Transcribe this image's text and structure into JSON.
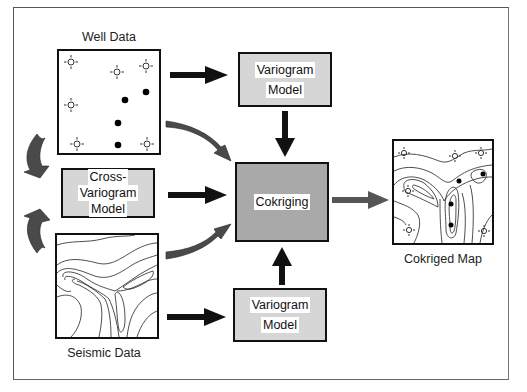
{
  "diagram": {
    "nodes": {
      "well_data": {
        "caption": "Well Data"
      },
      "variogram_top": {
        "line1": "Variogram",
        "line2": "Model"
      },
      "cross_variogram": {
        "line1": "Cross-",
        "line2": "Variogram",
        "line3": "Model"
      },
      "cokriging": {
        "label": "Cokriging"
      },
      "seismic_data": {
        "caption": "Seismic Data"
      },
      "variogram_bottom": {
        "line1": "Variogram",
        "line2": "Model"
      },
      "cokriged_map": {
        "caption": "Cokriged Map"
      }
    },
    "edges": [
      {
        "from": "Well Data",
        "to": "Variogram Model (top)",
        "style": "straight-black"
      },
      {
        "from": "Variogram Model (top)",
        "to": "Cokriging",
        "style": "straight-black"
      },
      {
        "from": "Well Data",
        "to": "Cokriging",
        "style": "curved-gray"
      },
      {
        "from": "Cross-Variogram Model",
        "to": "Cokriging",
        "style": "straight-black"
      },
      {
        "from": "Seismic Data",
        "to": "Cokriging",
        "style": "curved-gray"
      },
      {
        "from": "Seismic Data",
        "to": "Variogram Model (bottom)",
        "style": "straight-black"
      },
      {
        "from": "Variogram Model (bottom)",
        "to": "Cokriging",
        "style": "straight-black"
      },
      {
        "from": "Cokriging",
        "to": "Cokriged Map",
        "style": "straight-gray"
      },
      {
        "from": "Well Data",
        "to": "Cross-Variogram Model",
        "style": "curved-gray"
      },
      {
        "from": "Seismic Data",
        "to": "Cross-Variogram Model",
        "style": "curved-gray"
      }
    ],
    "well_markers": {
      "unsampled_wells": 6,
      "sampled_wells": 4
    },
    "colors": {
      "light_box": "#d6d6d6",
      "dark_box": "#a9a9a9",
      "curved_arrow": "#4a4a4a",
      "straight_arrow": "#111111",
      "output_arrow": "#555555"
    }
  }
}
